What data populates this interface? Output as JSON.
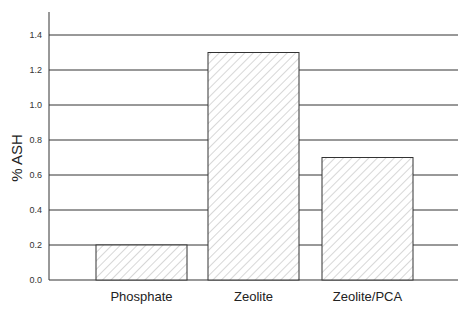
{
  "chart_data": {
    "type": "bar",
    "title": "",
    "xlabel": "",
    "ylabel": "% ASH",
    "categories": [
      "Phosphate",
      "Zeolite",
      "Zeolite/PCA"
    ],
    "values": [
      0.2,
      1.3,
      0.7
    ],
    "ylim": [
      0.0,
      1.5
    ],
    "yticks": [
      0.0,
      0.2,
      0.4,
      0.6,
      0.8,
      1.0,
      1.2,
      1.4
    ],
    "ytick_labels": [
      "0.0",
      "0.2",
      "0.4",
      "0.6",
      "0.8",
      "1.0",
      "1.2",
      "1.4"
    ],
    "grid": true,
    "legend": null,
    "bar_fill": "diagonal-hatch",
    "colors": {
      "bar_stroke": "#333333",
      "hatch": "#b0b0b0",
      "grid": "#333333",
      "axis": "#333333"
    }
  }
}
